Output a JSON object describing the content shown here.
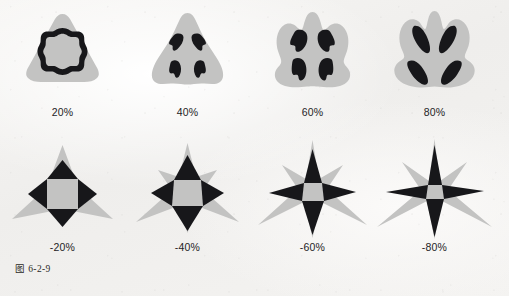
{
  "figure": {
    "caption": "图 6-2-9",
    "caption_label": "图",
    "caption_number": "6-2-9",
    "background_color": "#f3f2f0",
    "shape_gray": "#c3c3c2",
    "shape_black": "#17171a",
    "label_color": "#24231f"
  },
  "rows": [
    {
      "name": "positive-pucker-row",
      "cells": [
        {
          "label": "20%",
          "amount": 20,
          "direction": "positive"
        },
        {
          "label": "40%",
          "amount": 40,
          "direction": "positive"
        },
        {
          "label": "60%",
          "amount": 60,
          "direction": "positive"
        },
        {
          "label": "80%",
          "amount": 80,
          "direction": "positive"
        }
      ]
    },
    {
      "name": "negative-pucker-row",
      "cells": [
        {
          "label": "-20%",
          "amount": -20,
          "direction": "negative"
        },
        {
          "label": "-40%",
          "amount": -40,
          "direction": "negative"
        },
        {
          "label": "-60%",
          "amount": -60,
          "direction": "negative"
        },
        {
          "label": "-80%",
          "amount": -80,
          "direction": "negative"
        }
      ]
    }
  ]
}
